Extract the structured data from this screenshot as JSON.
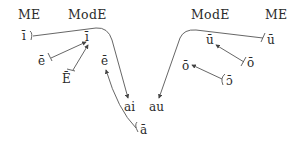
{
  "headers": {
    "left_me": "ME",
    "left_mode": "ModE",
    "right_mode": "ModE",
    "right_me": "ME"
  },
  "front_vowels": {
    "me_i_long": "ī",
    "me_e_long_close": "ē",
    "me_e_long_open": "Ē",
    "mode_i_long": "ī",
    "mode_e_long": "ē"
  },
  "back_vowels": {
    "me_u_long": "ū",
    "me_o_long_close": "ō",
    "me_o_long_open": "ɔ̄",
    "mode_u_long": "ū",
    "mode_o_long": "ō"
  },
  "diphthongs": {
    "ai": "ai",
    "au": "au"
  },
  "low": {
    "me_a_long": "ā"
  },
  "colors": {
    "line": "#555555",
    "text": "#2b2b2b"
  }
}
